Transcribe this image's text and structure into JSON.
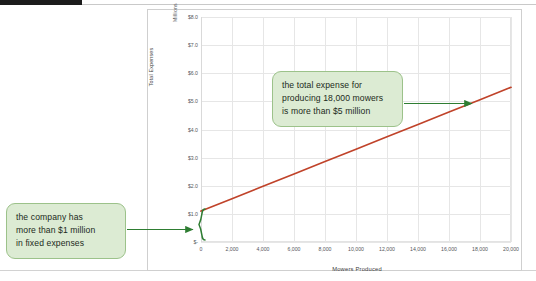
{
  "page": {
    "background_color": "#ffffff",
    "top_bar_color": "#1c1c1c"
  },
  "chart_data": {
    "type": "line",
    "title": "",
    "xlabel": "Mowers Produced",
    "ylabel": "Total Expenses",
    "y_units_label": "Millions",
    "xlim": [
      0,
      20000
    ],
    "ylim": [
      0,
      8.0
    ],
    "grid": true,
    "legend": "none",
    "line_color": "#C0432A",
    "x_tick_labels": [
      "0",
      "2,000",
      "4,000",
      "6,000",
      "8,000",
      "10,000",
      "12,000",
      "14,000",
      "16,000",
      "18,000",
      "20,000"
    ],
    "x_ticks": [
      0,
      2000,
      4000,
      6000,
      8000,
      10000,
      12000,
      14000,
      16000,
      18000,
      20000
    ],
    "y_tick_labels": [
      "$8.0",
      "$7.0",
      "$6.0",
      "$5.0",
      "$4.0",
      "$3.0",
      "$2.0",
      "$1.0",
      "$-"
    ],
    "y_ticks": [
      8.0,
      7.0,
      6.0,
      5.0,
      4.0,
      3.0,
      2.0,
      1.0,
      0
    ],
    "series": [
      {
        "name": "Total Expenses",
        "color": "#C0432A",
        "x": [
          0,
          2000,
          4000,
          6000,
          8000,
          10000,
          12000,
          14000,
          16000,
          18000,
          20000
        ],
        "values": [
          1.1,
          1.54,
          1.98,
          2.42,
          2.86,
          3.3,
          3.74,
          4.18,
          4.62,
          5.06,
          5.5
        ]
      }
    ],
    "annotations": [
      {
        "name": "fixed-expenses-callout",
        "text": "the company has more than $1 million in fixed expenses",
        "lines": [
          "the company has",
          "more than $1 million",
          "in fixed expenses"
        ],
        "points_to": {
          "x": 0,
          "y": 0.55
        },
        "marker": "brace",
        "color": "#2E7D32"
      },
      {
        "name": "total-expense-callout",
        "text": "the total expense for producing 18,000 mowers is more than $5 million",
        "lines": [
          "the total expense for",
          "producing 18,000 mowers",
          "is more than $5 million"
        ],
        "points_to": {
          "x": 18000,
          "y": 5.06
        },
        "marker": "arrow",
        "color": "#2E7D32"
      }
    ]
  },
  "callouts": {
    "left": {
      "line1": "the company has",
      "line2": "more than $1 million",
      "line3": "in fixed expenses"
    },
    "right": {
      "line1": "the total expense for",
      "line2": "producing 18,000 mowers",
      "line3": "is more than $5 million"
    }
  },
  "axis": {
    "x_title": "Mowers Produced",
    "y_title": "Total Expenses",
    "y_units": "Millions"
  }
}
